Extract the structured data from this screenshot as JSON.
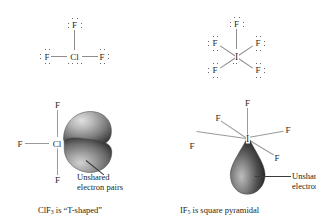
{
  "figure": {
    "title": "",
    "type": "chemistry-lewis-structure-and-molecular-geometry-figure",
    "panels": [
      {
        "id": "clf3-lewis",
        "position": "top-left",
        "description": "Lewis structure of chlorine trifluoride",
        "central_atom": "Cl",
        "terminal_atoms": [
          "F",
          "F",
          "F"
        ],
        "central_lone_pairs": 2,
        "terminal_lone_pairs_each": 3
      },
      {
        "id": "if5-lewis",
        "position": "top-right",
        "description": "Lewis structure of iodine pentafluoride",
        "central_atom": "I",
        "terminal_atoms": [
          "F",
          "F",
          "F",
          "F",
          "F"
        ],
        "central_lone_pairs": 1,
        "terminal_lone_pairs_each": 3
      },
      {
        "id": "clf3-geometry",
        "position": "bottom-left",
        "description": "T-shaped geometry of ClF3 with two unshared electron pair lobes",
        "central_atom": "Cl",
        "terminal_atoms": [
          "F",
          "F",
          "F"
        ],
        "lobes": 2
      },
      {
        "id": "if5-geometry",
        "position": "bottom-right",
        "description": "Square pyramidal geometry of IF5 with one unshared electron pair lobe",
        "central_atom": "I",
        "terminal_atoms": [
          "F",
          "F",
          "F",
          "F",
          "F"
        ],
        "lobes": 1
      }
    ]
  },
  "labels": {
    "fluorine": "F",
    "chlorine": "Cl",
    "iodine": "I"
  },
  "annotations": {
    "left_lobe_line1": "Unshared",
    "left_lobe_line2": "electron pairs",
    "right_lobe_line1": "Unshared",
    "right_lobe_line2": "electron pair"
  },
  "captions": {
    "left_prefix": "ClF",
    "left_sub": "3",
    "left_suffix": " is “T-shaped”",
    "left_full": "ClF3 is “T-shaped”",
    "right_prefix": "IF",
    "right_sub": "5",
    "right_suffix": " is square pyramidal",
    "right_full": "IF5 is square pyramidal"
  },
  "colors": {
    "text": "#231f20",
    "atom_text": "#2a2725",
    "bond": "#8d8d8d",
    "dot": "#3a3735",
    "lobe_dark": "#2f2f2f",
    "lobe_mid": "#7b7b7b",
    "lobe_light": "#c9c9c9",
    "background": "#ffffff",
    "leader": "#3b3b3b"
  }
}
